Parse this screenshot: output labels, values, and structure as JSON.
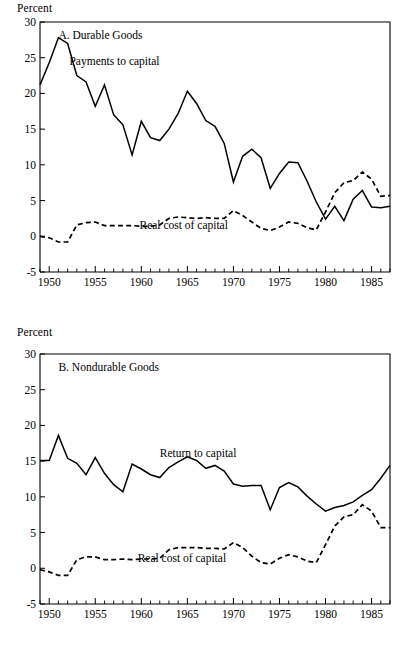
{
  "figure": {
    "background": "#ffffff",
    "ink": "#000000"
  },
  "panels": [
    {
      "id": "A",
      "title": "A. Durable Goods",
      "ylabel": "Percent"
    },
    {
      "id": "B",
      "title": "B. Nondurable Goods",
      "ylabel": "Percent"
    }
  ],
  "chart_data": [
    {
      "type": "line",
      "title": "A. Durable Goods",
      "xlabel": "",
      "ylabel": "Percent",
      "ylim": [
        -5,
        30
      ],
      "xlim": [
        1949,
        1987
      ],
      "yticks": [
        -5,
        0,
        5,
        10,
        15,
        20,
        25,
        30
      ],
      "xticks": [
        1950,
        1955,
        1960,
        1965,
        1970,
        1975,
        1980,
        1985
      ],
      "xtick_labels": [
        "1950",
        "1955",
        "1960",
        "1965",
        "1970",
        "1975",
        "1980",
        "1985"
      ],
      "ytick_labels": [
        "-5",
        "0",
        "5",
        "10",
        "15",
        "20",
        "25",
        "30"
      ],
      "grid": false,
      "legend": "inline-annotations",
      "x": [
        1949,
        1950,
        1951,
        1952,
        1953,
        1954,
        1955,
        1956,
        1957,
        1958,
        1959,
        1960,
        1961,
        1962,
        1963,
        1964,
        1965,
        1966,
        1967,
        1968,
        1969,
        1970,
        1971,
        1972,
        1973,
        1974,
        1975,
        1976,
        1977,
        1978,
        1979,
        1980,
        1981,
        1982,
        1983,
        1984,
        1985,
        1986,
        1987
      ],
      "series": [
        {
          "name": "Payments to capital",
          "style": "solid",
          "label_x": 1952.2,
          "label_y": 24.0,
          "values": [
            21.2,
            24.3,
            27.8,
            27.0,
            22.5,
            21.6,
            18.2,
            21.2,
            17.0,
            15.6,
            11.4,
            16.1,
            13.8,
            13.4,
            15.0,
            17.2,
            20.3,
            18.6,
            16.2,
            15.4,
            13.0,
            7.6,
            11.2,
            12.2,
            11.0,
            6.7,
            8.8,
            10.4,
            10.3,
            7.7,
            4.8,
            2.4,
            4.2,
            2.2,
            5.2,
            6.4,
            4.1,
            4.0,
            4.2
          ]
        },
        {
          "name": "Real cost of capital",
          "style": "dashed",
          "label_x": 1959.8,
          "label_y": 1.0,
          "values": [
            0.0,
            -0.2,
            -0.8,
            -0.8,
            1.6,
            1.9,
            2.0,
            1.5,
            1.5,
            1.5,
            1.5,
            1.4,
            1.4,
            1.6,
            2.5,
            2.7,
            2.6,
            2.5,
            2.6,
            2.5,
            2.5,
            3.6,
            2.9,
            2.0,
            1.1,
            0.8,
            1.3,
            2.0,
            1.8,
            1.2,
            0.9,
            3.4,
            6.1,
            7.5,
            7.8,
            9.0,
            8.0,
            5.6,
            5.7
          ]
        }
      ]
    },
    {
      "type": "line",
      "title": "B. Nondurable Goods",
      "xlabel": "",
      "ylabel": "Percent",
      "ylim": [
        -5,
        30
      ],
      "xlim": [
        1949,
        1987
      ],
      "yticks": [
        -5,
        0,
        5,
        10,
        15,
        20,
        25,
        30
      ],
      "xticks": [
        1950,
        1955,
        1960,
        1965,
        1970,
        1975,
        1980,
        1985
      ],
      "xtick_labels": [
        "1950",
        "1955",
        "1960",
        "1965",
        "1970",
        "1975",
        "1980",
        "1985"
      ],
      "ytick_labels": [
        "-5",
        "0",
        "5",
        "10",
        "15",
        "20",
        "25",
        "30"
      ],
      "grid": false,
      "legend": "inline-annotations",
      "x": [
        1949,
        1950,
        1951,
        1952,
        1953,
        1954,
        1955,
        1956,
        1957,
        1958,
        1959,
        1960,
        1961,
        1962,
        1963,
        1964,
        1965,
        1966,
        1967,
        1968,
        1969,
        1970,
        1971,
        1972,
        1973,
        1974,
        1975,
        1976,
        1977,
        1978,
        1979,
        1980,
        1981,
        1982,
        1983,
        1984,
        1985,
        1986,
        1987
      ],
      "series": [
        {
          "name": "Return to capital",
          "style": "solid",
          "label_x": 1962.0,
          "label_y": 15.6,
          "values": [
            15.1,
            15.1,
            18.6,
            15.4,
            14.7,
            13.1,
            15.5,
            13.3,
            11.7,
            10.7,
            14.6,
            13.9,
            13.1,
            12.7,
            14.1,
            14.9,
            15.6,
            15.1,
            14.0,
            14.4,
            13.6,
            11.8,
            11.5,
            11.6,
            11.6,
            8.2,
            11.3,
            12.0,
            11.4,
            10.1,
            9.0,
            8.0,
            8.5,
            8.8,
            9.3,
            10.2,
            11.0,
            12.6,
            14.4
          ]
        },
        {
          "name": "Real cost of capital",
          "style": "dashed",
          "label_x": 1959.6,
          "label_y": 0.9,
          "values": [
            -0.2,
            -0.5,
            -1.0,
            -1.0,
            1.2,
            1.6,
            1.6,
            1.2,
            1.2,
            1.3,
            1.2,
            1.3,
            1.3,
            1.4,
            2.6,
            2.9,
            2.9,
            2.9,
            2.8,
            2.8,
            2.7,
            3.6,
            2.9,
            1.7,
            0.8,
            0.6,
            1.4,
            1.9,
            1.6,
            1.0,
            0.8,
            3.3,
            5.9,
            7.2,
            7.5,
            8.9,
            8.0,
            5.7,
            5.7
          ]
        }
      ]
    }
  ]
}
